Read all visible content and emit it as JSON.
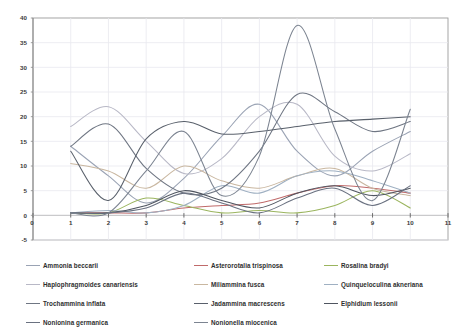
{
  "chart_data": {
    "type": "line",
    "title": "",
    "subtitle": "",
    "xlabel": "",
    "ylabel": "",
    "xlim": [
      0,
      11
    ],
    "ylim": [
      -5,
      40
    ],
    "x_ticks": [
      0,
      1,
      2,
      3,
      4,
      5,
      6,
      7,
      8,
      9,
      10,
      11
    ],
    "y_ticks": [
      -5,
      0,
      5,
      10,
      15,
      20,
      25,
      30,
      35,
      40
    ],
    "grid": true,
    "legend_position": "bottom",
    "x": [
      1,
      2,
      3,
      4,
      5,
      6,
      7,
      8,
      9,
      10
    ],
    "smoothing": "spline",
    "series": [
      {
        "name": "Ammonia beccarii",
        "color": "#9aa3b4",
        "values": [
          14.0,
          8.0,
          2.5,
          7.5,
          16.0,
          22.5,
          13.0,
          8.0,
          13.0,
          17.0
        ]
      },
      {
        "name": "Asterorotalia trispinosa",
        "color": "#c06a6a",
        "values": [
          0.5,
          0.5,
          0.5,
          1.5,
          2.0,
          2.5,
          4.5,
          6.0,
          5.5,
          4.5
        ]
      },
      {
        "name": "Rosalina bradyi",
        "color": "#9bb55f",
        "values": [
          0.5,
          0.5,
          3.5,
          2.0,
          0.5,
          1.0,
          0.5,
          2.0,
          5.0,
          1.5
        ]
      },
      {
        "name": "Haplophragmoides canariensis",
        "color": "#b8b8c6",
        "values": [
          18.0,
          22.0,
          15.0,
          8.5,
          11.5,
          20.0,
          22.5,
          12.0,
          9.0,
          12.5
        ]
      },
      {
        "name": "Miliammina fusca",
        "color": "#c9b7a0",
        "values": [
          10.5,
          9.0,
          5.5,
          10.0,
          7.0,
          5.5,
          8.0,
          9.5,
          5.5,
          4.0
        ]
      },
      {
        "name": "Quinqueloculina akneriana",
        "color": "#9fb0c2",
        "values": [
          0.5,
          1.0,
          0.5,
          2.0,
          6.0,
          4.5,
          8.0,
          9.0,
          7.0,
          4.5
        ]
      },
      {
        "name": "Trochammina inflata",
        "color": "#6f7683",
        "values": [
          14.0,
          18.5,
          9.5,
          4.5,
          5.5,
          13.0,
          24.5,
          21.0,
          17.0,
          19.0
        ]
      },
      {
        "name": "Jadammina macrescens",
        "color": "#59606b",
        "values": [
          13.0,
          3.0,
          15.5,
          19.0,
          16.5,
          17.0,
          18.0,
          19.0,
          19.5,
          20.0
        ]
      },
      {
        "name": "Elphidium lessonii",
        "color": "#4f5560",
        "values": [
          0.5,
          0.5,
          2.0,
          5.0,
          3.0,
          1.5,
          4.5,
          6.0,
          4.0,
          5.5
        ]
      },
      {
        "name": "Nonionina germanica",
        "color": "#6a7180",
        "values": [
          0.5,
          0.5,
          1.5,
          4.5,
          2.5,
          0.5,
          3.5,
          5.5,
          2.0,
          6.0
        ]
      },
      {
        "name": "Nonionella miocenica",
        "color": "#7c8491",
        "values": [
          0.5,
          0.5,
          9.0,
          17.0,
          4.0,
          12.0,
          38.5,
          17.5,
          3.0,
          21.5
        ]
      }
    ]
  },
  "axes": {
    "y_tick_labels": [
      "40",
      "35",
      "30",
      "25",
      "20",
      "15",
      "10",
      "5",
      "0",
      "-5"
    ],
    "x_tick_labels": [
      "0",
      "1",
      "2",
      "3",
      "4",
      "5",
      "6",
      "7",
      "8",
      "9",
      "10",
      "11"
    ]
  },
  "legend": {
    "rows": [
      [
        {
          "label": "Ammonia beccarii",
          "color": "#9aa3b4"
        },
        {
          "label": "Asterorotalia trispinosa",
          "color": "#c06a6a"
        },
        {
          "label": "Rosalina bradyi",
          "color": "#9bb55f"
        }
      ],
      [
        {
          "label": "Haplophragmoides canariensis",
          "color": "#b8b8c6"
        },
        {
          "label": "Miliammina fusca",
          "color": "#c9b7a0"
        },
        {
          "label": "Quinqueloculina akneriana",
          "color": "#9fb0c2"
        }
      ],
      [
        {
          "label": "Trochammina inflata",
          "color": "#6f7683"
        },
        {
          "label": "Jadammina macrescens",
          "color": "#59606b"
        },
        {
          "label": "Elphidium lessonii",
          "color": "#4f5560"
        }
      ],
      [
        {
          "label": "Nonionina germanica",
          "color": "#6a7180"
        },
        {
          "label": "Nonionella miocenica",
          "color": "#7c8491"
        }
      ]
    ]
  },
  "style": {
    "plot_border_color": "#9b9b9b",
    "grid_color": "#e9e9ef",
    "axis_color": "#8a8a8a",
    "background": "#ffffff"
  }
}
